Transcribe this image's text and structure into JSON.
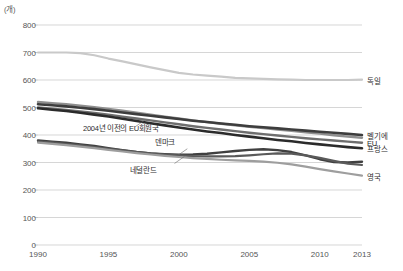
{
  "chart_data": {
    "type": "line",
    "title": "",
    "xlabel": "",
    "ylabel": "(개)",
    "unit_label": "(개)",
    "xlim": [
      1990,
      2013
    ],
    "ylim": [
      0,
      800
    ],
    "grid": "horizontal",
    "legend_position": "right-inline-and-annotation",
    "ytick_labels": [
      "0",
      "100",
      "200",
      "300",
      "400",
      "500",
      "600",
      "700",
      "800"
    ],
    "ytick_values": [
      0,
      100,
      200,
      300,
      400,
      500,
      600,
      700,
      800
    ],
    "xtick_labels": [
      "1990",
      "1995",
      "2000",
      "2005",
      "2010",
      "2013"
    ],
    "xtick_values": [
      1990,
      1995,
      2000,
      2005,
      2010,
      2013
    ],
    "x": [
      1990,
      1991,
      1992,
      1993,
      1994,
      1995,
      1996,
      1997,
      1998,
      1999,
      2000,
      2001,
      2002,
      2003,
      2004,
      2005,
      2006,
      2007,
      2008,
      2009,
      2010,
      2011,
      2012,
      2013
    ],
    "series": [
      {
        "name": "독일",
        "label": "독일",
        "color": "#c9c9c9",
        "width": 2.2,
        "label_placement": "right",
        "label_value": 600,
        "values": [
          700,
          700,
          700,
          698,
          690,
          678,
          668,
          657,
          646,
          636,
          626,
          620,
          616,
          612,
          608,
          606,
          604,
          602,
          601,
          600,
          600,
          600,
          600,
          601
        ]
      },
      {
        "name": "2004년 이전의 EU회원국",
        "label": "2004년 이전의 EU회원국",
        "color": "#8f8f8f",
        "width": 2.4,
        "label_placement": "inline",
        "label_x": 1993.2,
        "label_value": 430,
        "values": [
          520,
          516,
          512,
          507,
          501,
          495,
          488,
          481,
          474,
          467,
          460,
          453,
          447,
          441,
          435,
          430,
          425,
          420,
          415,
          410,
          405,
          399,
          394,
          390
        ]
      },
      {
        "name": "벨기에",
        "label": "벨기에",
        "color": "#3d3d3d",
        "width": 2.6,
        "label_placement": "right",
        "label_value": 400,
        "values": [
          512,
          508,
          504,
          499,
          494,
          488,
          482,
          476,
          470,
          464,
          458,
          452,
          447,
          442,
          437,
          432,
          428,
          424,
          420,
          416,
          412,
          408,
          404,
          400
        ]
      },
      {
        "name": "EU",
        "label": "EU",
        "color": "#6e6e6e",
        "width": 2.4,
        "label_placement": "right",
        "label_value": 372,
        "values": [
          500,
          496,
          491,
          486,
          480,
          474,
          467,
          460,
          453,
          446,
          439,
          432,
          426,
          420,
          414,
          408,
          403,
          398,
          393,
          388,
          384,
          380,
          376,
          372
        ]
      },
      {
        "name": "프랑스",
        "label": "프랑스",
        "color": "#2b2b2b",
        "width": 2.6,
        "label_placement": "right",
        "label_value": 352,
        "values": [
          497,
          492,
          487,
          481,
          474,
          467,
          459,
          451,
          443,
          435,
          427,
          420,
          413,
          407,
          400,
          394,
          388,
          382,
          377,
          371,
          366,
          361,
          356,
          352
        ]
      },
      {
        "name": "덴마크",
        "label": "덴마크",
        "color": "#404040",
        "width": 2.4,
        "label_placement": "inline",
        "label_x": 1998.3,
        "label_value": 378,
        "values": [
          380,
          376,
          372,
          366,
          360,
          352,
          345,
          338,
          333,
          330,
          328,
          329,
          332,
          337,
          342,
          346,
          348,
          345,
          338,
          326,
          312,
          302,
          300,
          303
        ]
      },
      {
        "name": "네덜란드",
        "label": "네덜란드",
        "color": "#5a5a5a",
        "width": 2.2,
        "label_placement": "inline",
        "label_x": 1996.5,
        "label_value": 275,
        "values": [
          376,
          372,
          367,
          362,
          356,
          350,
          344,
          338,
          333,
          329,
          326,
          323,
          322,
          322,
          323,
          326,
          330,
          333,
          332,
          326,
          317,
          306,
          296,
          291
        ]
      },
      {
        "name": "영국",
        "label": "영국",
        "color": "#9e9e9e",
        "width": 2.2,
        "label_placement": "right",
        "label_value": 252,
        "values": [
          372,
          368,
          363,
          358,
          352,
          346,
          340,
          334,
          329,
          324,
          320,
          316,
          313,
          310,
          308,
          306,
          303,
          299,
          293,
          285,
          276,
          268,
          260,
          252
        ]
      }
    ],
    "annotations": [
      {
        "text": "2004년 이전의 EU회원국",
        "anchor_year": 1997.6,
        "anchor_value": 455
      },
      {
        "text": "덴마크",
        "anchor_year": 2000.6,
        "anchor_value": 350
      },
      {
        "text": "네덜란드",
        "anchor_year": 2000.4,
        "anchor_value": 322
      }
    ]
  },
  "footnote": ""
}
